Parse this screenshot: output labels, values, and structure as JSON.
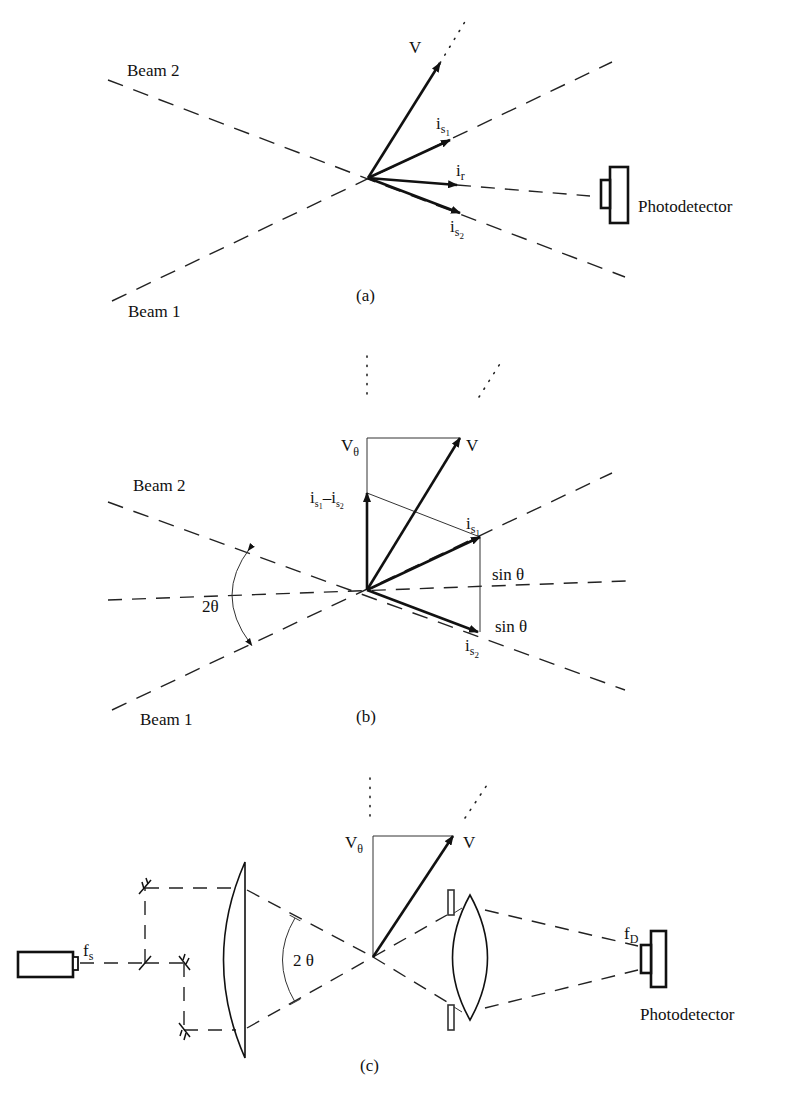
{
  "figure": {
    "panel_a": {
      "caption": "(a)",
      "beam1_label": "Beam 1",
      "beam2_label": "Beam 2",
      "vector_v": "V",
      "vector_is1": {
        "base": "i",
        "sub": "s",
        "subsub": "1"
      },
      "vector_is2": {
        "base": "i",
        "sub": "s",
        "subsub": "2"
      },
      "vector_ir": {
        "base": "i",
        "sub": "r"
      },
      "detector_label": "Photodetector"
    },
    "panel_b": {
      "caption": "(b)",
      "beam1_label": "Beam 1",
      "beam2_label": "Beam 2",
      "vector_v": "V",
      "vector_vtheta": {
        "base": "V",
        "sub": "θ"
      },
      "difference_label": {
        "a_base": "i",
        "a_sub": "s",
        "a_subsub": "1",
        "minus": "–",
        "b_base": "i",
        "b_sub": "s",
        "b_subsub": "2"
      },
      "vector_is1": {
        "base": "i",
        "sub": "s",
        "subsub": "1"
      },
      "vector_is2": {
        "base": "i",
        "sub": "s",
        "subsub": "2"
      },
      "sin_upper": "sin θ",
      "sin_lower": "sin θ",
      "angle_label": "2θ"
    },
    "panel_c": {
      "caption": "(c)",
      "source_freq": {
        "base": "f",
        "sub": "s"
      },
      "detector_freq": {
        "base": "f",
        "sub": "D"
      },
      "vector_v": "V",
      "vector_vtheta": {
        "base": "V",
        "sub": "θ"
      },
      "angle_label": "2 θ",
      "detector_label": "Photodetector"
    }
  }
}
